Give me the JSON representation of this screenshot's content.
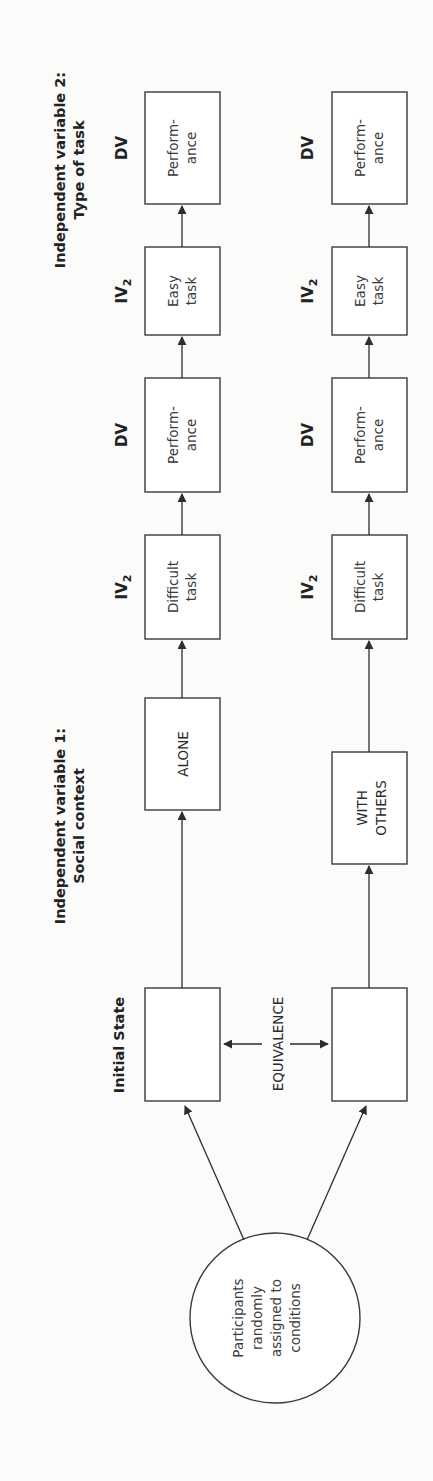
{
  "figure": {
    "orientation": "rotated 90 degrees counter-clockwise",
    "headings": {
      "iv1_line1": "Independent variable 1:",
      "iv1_line2": "Social context",
      "iv2_line1": "Independent variable 2:",
      "iv2_line2": "Type of task",
      "initial_state": "Initial State"
    },
    "start_node": {
      "line1": "Participants",
      "line2": "randomly",
      "line3": "assigned to",
      "line4": "conditions"
    },
    "equivalence_label": "EQUIVALENCE",
    "rows": [
      {
        "condition_line1": "ALONE",
        "condition_line2": "",
        "steps": [
          {
            "tag": "IV",
            "sub": "2",
            "line1": "Difficult",
            "line2": "task"
          },
          {
            "tag": "DV",
            "sub": "",
            "line1": "Perform-",
            "line2": "ance"
          },
          {
            "tag": "IV",
            "sub": "2",
            "line1": "Easy",
            "line2": "task"
          },
          {
            "tag": "DV",
            "sub": "",
            "line1": "Perform-",
            "line2": "ance"
          }
        ]
      },
      {
        "condition_line1": "WITH",
        "condition_line2": "OTHERS",
        "steps": [
          {
            "tag": "IV",
            "sub": "2",
            "line1": "Difficult",
            "line2": "task"
          },
          {
            "tag": "DV",
            "sub": "",
            "line1": "Perform-",
            "line2": "ance"
          },
          {
            "tag": "IV",
            "sub": "2",
            "line1": "Easy",
            "line2": "task"
          },
          {
            "tag": "DV",
            "sub": "",
            "line1": "Perform-",
            "line2": "ance"
          }
        ]
      }
    ]
  }
}
